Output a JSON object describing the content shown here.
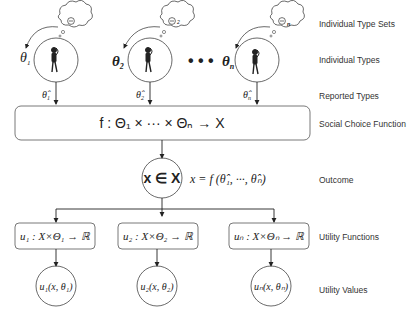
{
  "labels": {
    "type_sets": "Individual Type Sets",
    "types": "Individual Types",
    "reported": "Reported Types",
    "scf": "Social Choice Function",
    "outcome": "Outcome",
    "utility_functions": "Utility Functions",
    "utility_values": "Utility Values"
  },
  "agents": [
    {
      "type_set": "Θ",
      "type_set_sub": "",
      "type": "θ",
      "type_sub": "1",
      "reported": "θ̂",
      "reported_sub": "1"
    },
    {
      "type_set": "Θ",
      "type_set_sub": "2",
      "type": "θ",
      "type_sub": "2",
      "reported": "θ̂",
      "reported_sub": "2"
    },
    {
      "type_set": "Θ",
      "type_set_sub": "n",
      "type": "θ",
      "type_sub": "n",
      "reported": "θ̂",
      "reported_sub": "n"
    }
  ],
  "ellipsis": "• • •",
  "scf": {
    "formula": "f : Θ₁ × ··· × Θₙ → X"
  },
  "outcome": {
    "node": "x ∈ X",
    "formula": "x = f (θ̂₁, ···, θ̂ₙ)"
  },
  "utility_functions": [
    "u₁ : X×Θ₁ → ℝ",
    "u₂ : X×Θ₂ → ℝ",
    "uₙ : X×Θₙ → ℝ"
  ],
  "utility_values": [
    "u₁(x, θ₁)",
    "u₂(x, θ₂)",
    "uₙ(x, θₙ)"
  ]
}
